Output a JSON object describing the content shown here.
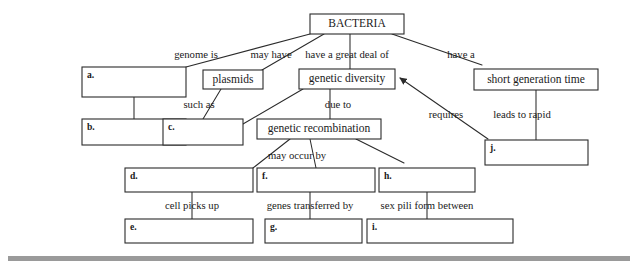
{
  "diagram": {
    "title": "BACTERIA",
    "type": "concept-map",
    "root": {
      "label": "BACTERIA",
      "x": 310,
      "y": 14,
      "w": 94,
      "h": 20
    },
    "concept_nodes": [
      {
        "id": "plasmids",
        "label": "plasmids",
        "x": 203,
        "y": 70,
        "w": 60,
        "h": 19
      },
      {
        "id": "genetic-diversity",
        "label": "genetic diversity",
        "x": 299,
        "y": 69,
        "w": 96,
        "h": 20
      },
      {
        "id": "short-generation-time",
        "label": "short generation time",
        "x": 474,
        "y": 69,
        "w": 124,
        "h": 21
      },
      {
        "id": "genetic-recombination",
        "label": "genetic recombination",
        "x": 257,
        "y": 119,
        "w": 124,
        "h": 20
      }
    ],
    "answer_boxes": [
      {
        "id": "a",
        "letter": "a.",
        "x": 82,
        "y": 67,
        "w": 104,
        "h": 30
      },
      {
        "id": "b",
        "letter": "b.",
        "x": 82,
        "y": 119,
        "w": 104,
        "h": 26
      },
      {
        "id": "c",
        "letter": "c.",
        "x": 163,
        "y": 119,
        "w": 80,
        "h": 26
      },
      {
        "id": "d",
        "letter": "d.",
        "x": 125,
        "y": 168,
        "w": 128,
        "h": 24
      },
      {
        "id": "e",
        "letter": "e.",
        "x": 125,
        "y": 219,
        "w": 128,
        "h": 24
      },
      {
        "id": "f",
        "letter": "f.",
        "x": 257,
        "y": 168,
        "w": 118,
        "h": 24
      },
      {
        "id": "g",
        "letter": "g.",
        "x": 265,
        "y": 219,
        "w": 97,
        "h": 24
      },
      {
        "id": "h",
        "letter": "h.",
        "x": 379,
        "y": 168,
        "w": 96,
        "h": 24
      },
      {
        "id": "i",
        "letter": "i.",
        "x": 367,
        "y": 219,
        "w": 146,
        "h": 24
      },
      {
        "id": "j",
        "letter": "j.",
        "x": 485,
        "y": 140,
        "w": 103,
        "h": 25
      }
    ],
    "link_labels": [
      {
        "id": "genome-is",
        "text": "genome is",
        "x": 196,
        "y": 56
      },
      {
        "id": "may-have",
        "text": "may have",
        "x": 271,
        "y": 56
      },
      {
        "id": "have-a-great-deal-of",
        "text": "have a great deal of",
        "x": 347,
        "y": 56
      },
      {
        "id": "have-a",
        "text": "have a",
        "x": 461,
        "y": 56
      },
      {
        "id": "such-as",
        "text": "such as",
        "x": 199,
        "y": 106
      },
      {
        "id": "due-to",
        "text": "due to",
        "x": 338,
        "y": 106
      },
      {
        "id": "requires",
        "text": "requires",
        "x": 446,
        "y": 116
      },
      {
        "id": "leads-to-rapid",
        "text": "leads to rapid",
        "x": 522,
        "y": 116
      },
      {
        "id": "may-occur-by",
        "text": "may occur by",
        "x": 297,
        "y": 157
      },
      {
        "id": "cell-picks-up",
        "text": "cell picks up",
        "x": 192,
        "y": 207
      },
      {
        "id": "genes-transferred-by",
        "text": "genes transferred by",
        "x": 310,
        "y": 207
      },
      {
        "id": "sex-pili-form-between",
        "text": "sex pili form between",
        "x": 427,
        "y": 207
      }
    ],
    "connectors": [
      {
        "id": "bacteria-to-a",
        "points": "310,34 186,67"
      },
      {
        "id": "bacteria-to-plasmids",
        "points": "324,34 262,70"
      },
      {
        "id": "bacteria-to-genetic-diversity",
        "points": "350,34 350,69"
      },
      {
        "id": "bacteria-to-short-generation",
        "points": "392,34 482,65"
      },
      {
        "id": "a-to-b",
        "points": "134,97 134,119"
      },
      {
        "id": "plasmids-to-c",
        "points": "221,89 203,119"
      },
      {
        "id": "genetic-diversity-to-recombination",
        "points": "330,89 330,119"
      },
      {
        "id": "genetic-diversity-to-c",
        "points": "303,89 243,124"
      },
      {
        "id": "short-generation-to-j",
        "points": "536,90 536,140"
      },
      {
        "id": "recombination-to-d",
        "points": "290,139 253,168"
      },
      {
        "id": "recombination-to-f",
        "points": "310,139 316,168"
      },
      {
        "id": "recombination-to-h",
        "points": "356,139 404,163"
      },
      {
        "id": "d-to-e",
        "points": "192,192 192,219"
      },
      {
        "id": "f-to-g",
        "points": "310,192 310,219"
      },
      {
        "id": "h-to-i",
        "points": "427,192 427,219"
      }
    ],
    "arrows": [
      {
        "id": "j-to-genetic-diversity",
        "from": "j",
        "to": "genetic-diversity",
        "points": "488,139 400,78"
      }
    ],
    "footer_rule": {
      "x": 8,
      "y": 256,
      "w": 622,
      "h": 5,
      "color": "#9a9a9a"
    }
  }
}
